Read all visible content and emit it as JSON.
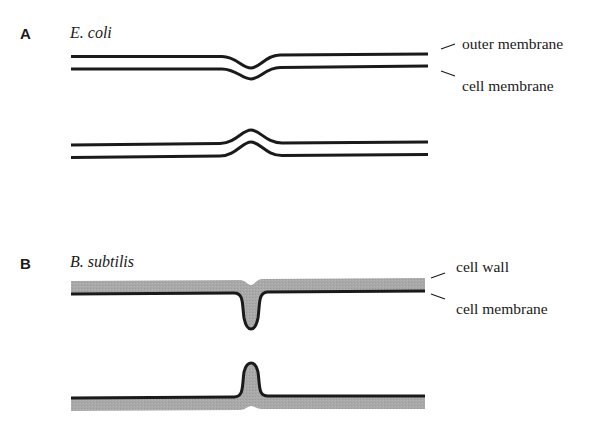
{
  "panels": [
    {
      "letter": "A",
      "organism": "E. coli",
      "labels": [
        "outer membrane",
        "cell membrane"
      ],
      "description": "Two parallel membranes (outer membrane and cell membrane); upper pair dips inward (V shape), lower pair bulges outward (bump)."
    },
    {
      "letter": "B",
      "organism": "B. subtilis",
      "labels": [
        "cell wall",
        "cell membrane"
      ],
      "description": "Thick gray cell wall above black cell membrane; upper membrane invaginates deeply into the wall, lower membrane protrudes into the wall."
    }
  ],
  "colors": {
    "line": "#1a1a1a",
    "wall": "#a9a9a9",
    "background": "#ffffff"
  }
}
